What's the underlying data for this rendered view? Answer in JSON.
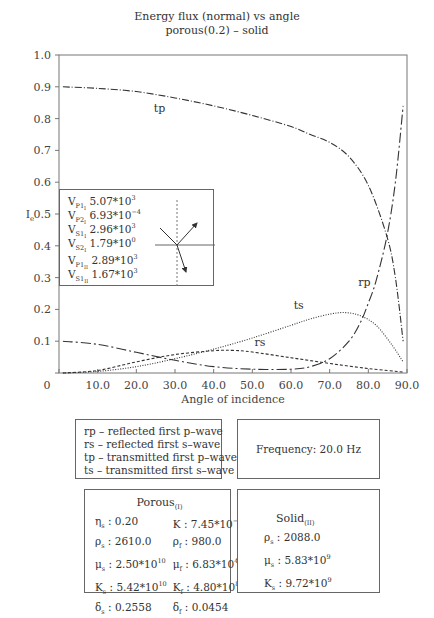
{
  "chart_data": {
    "type": "line",
    "title": "Energy flux (normal) vs angle",
    "subtitle": "porous(0.2) – solid",
    "xlabel": "Angle of incidence",
    "ylabel": "I_e",
    "xlim": [
      0,
      90
    ],
    "ylim": [
      0,
      1.0
    ],
    "x_ticks": [
      "0",
      "10.0",
      "20.0",
      "30.0",
      "40.0",
      "50.0",
      "60.0",
      "70.0",
      "80.0",
      "90.0"
    ],
    "y_ticks": [
      "0.1",
      "0.2",
      "0.3",
      "0.4",
      "0.5",
      "0.6",
      "0.7",
      "0.8",
      "0.9",
      "1.0"
    ],
    "grid": false,
    "series": [
      {
        "name": "tp",
        "style": "dash-dot",
        "x": [
          1,
          10,
          20,
          30,
          40,
          50,
          60,
          65,
          70,
          75,
          80,
          84.8,
          87,
          89
        ],
        "values": [
          0.9,
          0.895,
          0.885,
          0.865,
          0.84,
          0.81,
          0.775,
          0.75,
          0.725,
          0.68,
          0.59,
          0.43,
          0.3,
          0.1
        ]
      },
      {
        "name": "rp",
        "style": "long-dash-dot",
        "x": [
          1,
          10,
          20,
          30,
          40,
          50,
          60,
          65,
          70,
          75,
          78,
          80,
          82,
          84.8,
          87,
          89
        ],
        "values": [
          0.1,
          0.09,
          0.065,
          0.04,
          0.02,
          0.012,
          0.012,
          0.02,
          0.045,
          0.1,
          0.16,
          0.22,
          0.29,
          0.43,
          0.6,
          0.84
        ]
      },
      {
        "name": "ts",
        "style": "dotted",
        "x": [
          1,
          10,
          20,
          30,
          40,
          50,
          60,
          65,
          70,
          74,
          78,
          82,
          86,
          89
        ],
        "values": [
          0.0,
          0.005,
          0.02,
          0.045,
          0.075,
          0.11,
          0.15,
          0.17,
          0.185,
          0.19,
          0.18,
          0.15,
          0.09,
          0.035
        ]
      },
      {
        "name": "rs",
        "style": "dashed",
        "x": [
          1,
          10,
          20,
          30,
          40,
          45,
          50,
          60,
          70,
          80,
          89
        ],
        "values": [
          0.0,
          0.008,
          0.035,
          0.058,
          0.07,
          0.071,
          0.066,
          0.048,
          0.03,
          0.014,
          0.003
        ]
      }
    ],
    "curve_labels": [
      {
        "text": "tp",
        "x": 26,
        "y": 0.82
      },
      {
        "text": "rp",
        "x": 79,
        "y": 0.275
      },
      {
        "text": "ts",
        "x": 62,
        "y": 0.2
      },
      {
        "text": "rs",
        "x": 52,
        "y": 0.085
      }
    ]
  },
  "inset": {
    "velocities_I": [
      {
        "sym": "V",
        "sub": "P1",
        "subsub": "I",
        "value": "5.07*10",
        "exp": "3"
      },
      {
        "sym": "V",
        "sub": "P2",
        "subsub": "I",
        "value": "6.93*10",
        "exp": "−4"
      },
      {
        "sym": "V",
        "sub": "S1",
        "subsub": "I",
        "value": "2.96*10",
        "exp": "3"
      },
      {
        "sym": "V",
        "sub": "S2",
        "subsub": "I",
        "value": "1.79*10",
        "exp": "0"
      }
    ],
    "velocities_II": [
      {
        "sym": "V",
        "sub": "P1",
        "subsub": "II",
        "value": "2.89*10",
        "exp": "3"
      },
      {
        "sym": "V",
        "sub": "S1",
        "subsub": "II",
        "value": "1.67*10",
        "exp": "3"
      }
    ]
  },
  "legend": {
    "lines": [
      "rp – reflected first p–wave",
      "rs – reflected first s–wave",
      "tp – transmitted first p–wave",
      "ts – transmitted first s–wave"
    ]
  },
  "frequency": {
    "text": "Frequency: 20.0 Hz"
  },
  "porous": {
    "title": "Porous",
    "title_sub": "(I)",
    "params": [
      {
        "sym": "η",
        "sub": "s",
        "val": ": 0.20",
        "exp": ""
      },
      {
        "sym": "K",
        "sub": "",
        "val": ": 7.45*10",
        "exp": "−14"
      },
      {
        "sym": "ρ",
        "sub": "s",
        "val": ": 2610.0",
        "exp": ""
      },
      {
        "sym": "ρ",
        "sub": "f",
        "val": ": 980.0",
        "exp": ""
      },
      {
        "sym": "μ",
        "sub": "s",
        "val": ": 2.50*10",
        "exp": "10"
      },
      {
        "sym": "μ",
        "sub": "f",
        "val": ": 6.83*10",
        "exp": "4"
      },
      {
        "sym": "K",
        "sub": "s",
        "val": ": 5.42*10",
        "exp": "10"
      },
      {
        "sym": "K",
        "sub": "f",
        "val": ": 4.80*10",
        "exp": "8"
      },
      {
        "sym": "δ",
        "sub": "s",
        "val": ": 0.2558",
        "exp": ""
      },
      {
        "sym": "δ",
        "sub": "f",
        "val": ": 0.0454",
        "exp": ""
      }
    ]
  },
  "solid": {
    "title": "Solid",
    "title_sub": "(II)",
    "params": [
      {
        "sym": "ρ",
        "sub": "s",
        "val": ": 2088.0",
        "exp": ""
      },
      {
        "sym": "μ",
        "sub": "s",
        "val": ": 5.83*10",
        "exp": "9"
      },
      {
        "sym": "K",
        "sub": "s",
        "val": ": 9.72*10",
        "exp": "9"
      }
    ]
  },
  "colors": {
    "axis": "#777777",
    "curve": "#333333",
    "text": "#333333"
  }
}
